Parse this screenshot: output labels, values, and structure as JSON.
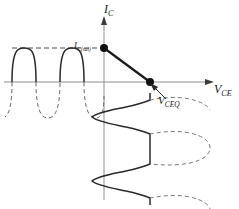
{
  "figure": {
    "background_color": "#ffffff",
    "line_color": "#1a1a1a",
    "width": 239,
    "height": 209
  },
  "axes": {
    "vertical": {
      "name": "collector-current-axis",
      "label_main": "I",
      "label_sub": "C",
      "arrow": "up"
    },
    "horizontal": {
      "name": "collector-emitter-voltage-axis",
      "label_main": "V",
      "label_sub": "CE",
      "arrow": "right"
    }
  },
  "annotations": {
    "saturation": {
      "label_main": "I",
      "label_sub": "C",
      "label_sub_small": "(sat)",
      "style": "dashed-horizontal-line"
    },
    "quiescent_voltage": {
      "label_main": "V",
      "label_sub": "CEQ",
      "style": "leader-arrow-to-point"
    }
  },
  "markers": [
    {
      "name": "saturation-point-dot",
      "x": 104,
      "y": 48
    },
    {
      "name": "cutoff-q-point-dot",
      "x": 150,
      "y": 82
    }
  ],
  "load_line": {
    "name": "dc-load-line",
    "from_x": 104,
    "from_y": 48,
    "to_x": 150,
    "to_y": 82
  },
  "waveforms": {
    "collector_current": {
      "name": "clipped-collector-current-waveform",
      "orientation": "horizontal",
      "solid_part": "positive-half-cycles-clipped-at-saturation",
      "dashed_part": "negative-half-cycles"
    },
    "collector_voltage": {
      "name": "clipped-collector-voltage-waveform",
      "orientation": "vertical",
      "solid_part": "left-half-cycles",
      "dashed_part": "right-half-cycles-clipped"
    }
  }
}
